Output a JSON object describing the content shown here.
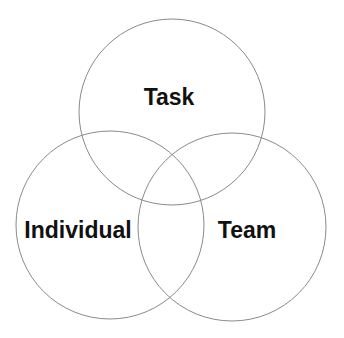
{
  "diagram": {
    "type": "venn",
    "stroke_color": "#8a8a8a",
    "circles": [
      {
        "label": "Task",
        "cx": 172,
        "cy": 112,
        "r": 93
      },
      {
        "label": "Individual",
        "cx": 110,
        "cy": 225,
        "r": 94
      },
      {
        "label": "Team",
        "cx": 232,
        "cy": 227,
        "r": 94
      }
    ]
  }
}
